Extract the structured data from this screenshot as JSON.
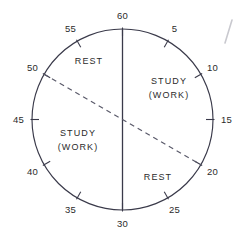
{
  "figure": {
    "type": "clock-dial-schedule",
    "title": "",
    "geometry": {
      "center_x": 122.5,
      "center_y": 119.5,
      "radius": 90.5,
      "minutes_per_revolution": 60
    },
    "stroke_color": "#3a3a4a",
    "dash_color": "#5a5a6a",
    "text_color": "#2b2b2b",
    "background_color": "#ffffff"
  },
  "dial": {
    "tick_interval_minutes": 5,
    "ticks": [
      {
        "value": "60",
        "minute": 60,
        "label_radius": 104,
        "tick_len": 7
      },
      {
        "value": "5",
        "minute": 5,
        "label_radius": 104,
        "tick_len": 7
      },
      {
        "value": "10",
        "minute": 10,
        "label_radius": 104,
        "tick_len": 7
      },
      {
        "value": "15",
        "minute": 15,
        "label_radius": 104,
        "tick_len": 7
      },
      {
        "value": "20",
        "minute": 20,
        "label_radius": 104,
        "tick_len": 7
      },
      {
        "value": "25",
        "minute": 25,
        "label_radius": 104,
        "tick_len": 7
      },
      {
        "value": "30",
        "minute": 30,
        "label_radius": 104,
        "tick_len": 7
      },
      {
        "value": "35",
        "minute": 35,
        "label_radius": 104,
        "tick_len": 7
      },
      {
        "value": "40",
        "minute": 40,
        "label_radius": 104,
        "tick_len": 7
      },
      {
        "value": "45",
        "minute": 45,
        "label_radius": 104,
        "tick_len": 7
      },
      {
        "value": "50",
        "minute": 50,
        "label_radius": 104,
        "tick_len": 7
      },
      {
        "value": "55",
        "minute": 55,
        "label_radius": 104,
        "tick_len": 7
      }
    ]
  },
  "lines": {
    "diameter": {
      "name": "vertical-diameter",
      "style": "solid",
      "from_minute": 60,
      "to_minute": 30
    },
    "chord": {
      "name": "dashed-chord",
      "style": "dashed",
      "from_minute": 50,
      "to_minute": 20
    }
  },
  "regions": [
    {
      "id": "rest-top",
      "line1": "REST",
      "line2": "",
      "x": 89,
      "y": 62
    },
    {
      "id": "study-right",
      "line1": "STUDY",
      "line2": "(WORK)",
      "x": 169,
      "y": 89
    },
    {
      "id": "study-left",
      "line1": "STUDY",
      "line2": "(WORK)",
      "x": 78,
      "y": 141
    },
    {
      "id": "rest-bottom",
      "line1": "REST",
      "line2": "",
      "x": 158,
      "y": 178
    }
  ],
  "artifact": {
    "id": "scan-mark",
    "description": "stray pen stroke",
    "x1": 232,
    "y1": 20,
    "x2": 225,
    "y2": 43
  }
}
